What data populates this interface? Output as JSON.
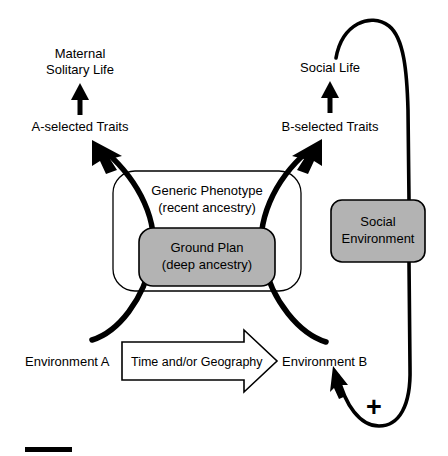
{
  "figure": {
    "type": "conceptual-flow-diagram",
    "background_color": "#ffffff",
    "line_color": "#000000",
    "shaded_fill_color": "#b3b3b3",
    "width": 448,
    "height": 456
  },
  "labels": {
    "maternal_line1": "Maternal",
    "maternal_line2": "Solitary Life",
    "a_selected": "A-selected Traits",
    "social_life": "Social Life",
    "b_selected": "B-selected Traits",
    "generic_line1": "Generic Phenotype",
    "generic_line2": "(recent ancestry)",
    "ground_line1": "Ground Plan",
    "ground_line2": "(deep ancestry)",
    "social_env_line1": "Social",
    "social_env_line2": "Environment",
    "environment_a": "Environment A",
    "environment_b": "Environment B",
    "time_geography": "Time and/or Geography",
    "plus_sign": "+"
  },
  "nodes": [
    {
      "id": "generic-phenotype",
      "label": "Generic Phenotype (recent ancestry)",
      "shape": "rounded-rect",
      "fill": "#ffffff"
    },
    {
      "id": "ground-plan",
      "label": "Ground Plan (deep ancestry)",
      "shape": "rounded-rect",
      "fill": "#b3b3b3"
    },
    {
      "id": "social-environment",
      "label": "Social Environment",
      "shape": "rounded-rect",
      "fill": "#b3b3b3"
    },
    {
      "id": "time-geography",
      "label": "Time and/or Geography",
      "shape": "block-arrow",
      "fill": "#ffffff"
    }
  ],
  "connections": [
    {
      "id": "env-a-to-a-traits",
      "from": "Environment A",
      "to": "A-selected Traits",
      "style": "thick-curved-arrow"
    },
    {
      "id": "env-b-to-b-traits",
      "from": "Environment B",
      "to": "B-selected Traits",
      "style": "thick-curved-arrow"
    },
    {
      "id": "a-traits-to-maternal",
      "from": "A-selected Traits",
      "to": "Maternal Solitary Life",
      "style": "straight-arrow-up"
    },
    {
      "id": "b-traits-to-social-life",
      "from": "B-selected Traits",
      "to": "Social Life",
      "style": "straight-arrow-up"
    },
    {
      "id": "social-life-to-social-env",
      "from": "Social Life",
      "to": "Social Environment",
      "style": "long-curve"
    },
    {
      "id": "social-env-to-env-b",
      "from": "Social Environment",
      "to": "Environment B",
      "style": "feedback-curve-arrow",
      "sign": "+"
    },
    {
      "id": "env-a-to-env-b",
      "from": "Environment A",
      "to": "Environment B",
      "style": "block-arrow"
    }
  ],
  "marks": {
    "scale_bar": "horizontal black bar"
  }
}
